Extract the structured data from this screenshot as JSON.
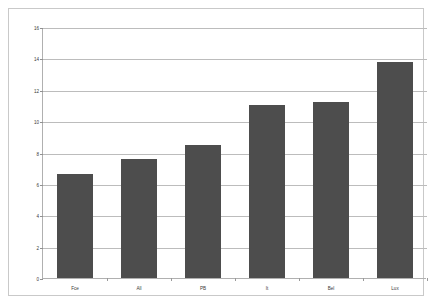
{
  "chart_data": {
    "type": "bar",
    "title": "",
    "subtitle": "",
    "xlabel": "",
    "ylabel": "",
    "categories": [
      "Fce",
      "All",
      "PB",
      "It",
      "Bel",
      "Lux"
    ],
    "values": [
      6.6,
      7.6,
      8.5,
      11.0,
      11.25,
      13.8
    ],
    "series": [
      {
        "name": "",
        "values": [
          6.6,
          7.6,
          8.5,
          11.0,
          11.25,
          13.8
        ]
      }
    ],
    "ylim": [
      0,
      16
    ],
    "ytick_step": 2,
    "ytick_labels": [
      "0",
      "2",
      "4",
      "6",
      "8",
      "10",
      "12",
      "14",
      "16"
    ],
    "ytick_values": [
      0,
      2,
      4,
      6,
      8,
      10,
      12,
      14,
      16
    ],
    "xlim_categories": 6,
    "grid": true,
    "grid_axis": "y",
    "legend": false,
    "legend_position": "none",
    "annotations": [],
    "colors": {
      "bar": "#4d4d4d",
      "gridline": "#bcbcbc",
      "axis": "#b0b0b0",
      "frame": "#c9c9c9",
      "text": "#3a3a3a",
      "background": "#ffffff"
    }
  }
}
